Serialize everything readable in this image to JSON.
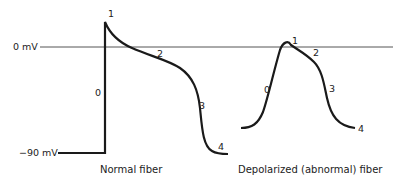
{
  "diagram": {
    "axis_labels": {
      "zero": "0 mV",
      "resting": "−90 mV"
    },
    "normal_fiber": {
      "caption": "Normal fiber",
      "phases": [
        "0",
        "1",
        "2",
        "3",
        "4"
      ]
    },
    "depolarized_fiber": {
      "caption": "Depolarized (abnormal) fiber",
      "phases": [
        "0",
        "1",
        "2",
        "3",
        "4"
      ]
    },
    "colors": {
      "trace": "#1a1a1a",
      "reference_line": "#555555",
      "background": "#ffffff"
    }
  }
}
